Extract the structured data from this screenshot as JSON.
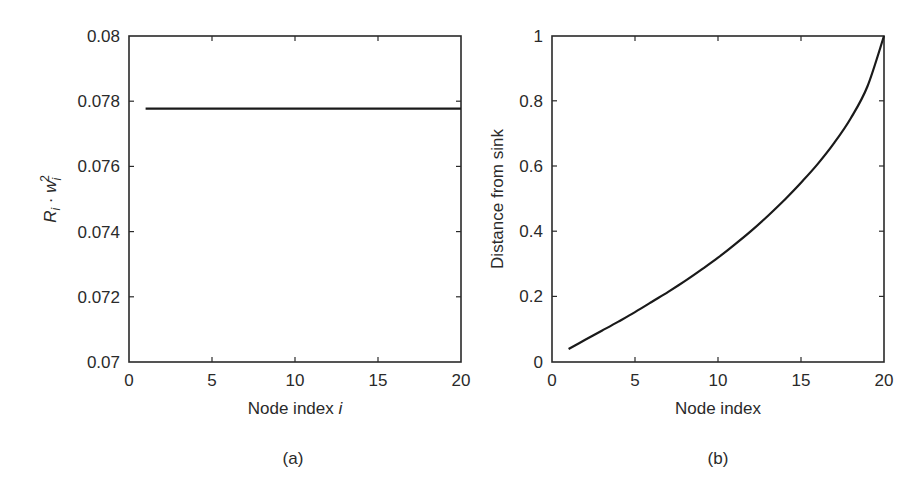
{
  "chart_data": [
    {
      "panel": "(a)",
      "type": "line",
      "title": "",
      "xlabel": "Node index i",
      "ylabel": "R_i · w_i^2",
      "ylabel_display": {
        "base1": "R",
        "sub1": "i",
        "dot": " · ",
        "base2": "w",
        "sub2": "i",
        "sup2": "2"
      },
      "xlim": [
        0,
        20
      ],
      "ylim": [
        0.07,
        0.08
      ],
      "xticks": [
        0,
        5,
        10,
        15,
        20
      ],
      "yticks": [
        0.07,
        0.072,
        0.074,
        0.076,
        0.078,
        0.08
      ],
      "xtick_labels": [
        "0",
        "5",
        "10",
        "15",
        "20"
      ],
      "ytick_labels": [
        "0.07",
        "0.072",
        "0.074",
        "0.076",
        "0.078",
        "0.08"
      ],
      "grid": false,
      "series": [
        {
          "name": "R_i·w_i^2",
          "x": [
            1,
            2,
            3,
            4,
            5,
            6,
            7,
            8,
            9,
            10,
            11,
            12,
            13,
            14,
            15,
            16,
            17,
            18,
            19,
            20
          ],
          "values": [
            0.07777,
            0.07777,
            0.07777,
            0.07777,
            0.07777,
            0.07777,
            0.07777,
            0.07777,
            0.07777,
            0.07777,
            0.07777,
            0.07777,
            0.07777,
            0.07777,
            0.07777,
            0.07777,
            0.07777,
            0.07777,
            0.07777,
            0.07777
          ]
        }
      ]
    },
    {
      "panel": "(b)",
      "type": "line",
      "title": "",
      "xlabel": "Node index",
      "ylabel": "Distance from sink",
      "xlim": [
        0,
        20
      ],
      "ylim": [
        0,
        1
      ],
      "xticks": [
        0,
        5,
        10,
        15,
        20
      ],
      "yticks": [
        0,
        0.2,
        0.4,
        0.6,
        0.8,
        1
      ],
      "xtick_labels": [
        "0",
        "5",
        "10",
        "15",
        "20"
      ],
      "ytick_labels": [
        "0",
        "0.2",
        "0.4",
        "0.6",
        "0.8",
        "1"
      ],
      "grid": false,
      "series": [
        {
          "name": "Distance from sink",
          "x": [
            1,
            2,
            3,
            4,
            5,
            6,
            7,
            8,
            9,
            10,
            11,
            12,
            13,
            14,
            15,
            16,
            17,
            18,
            19,
            20
          ],
          "values": [
            0.04,
            0.068,
            0.096,
            0.124,
            0.153,
            0.184,
            0.215,
            0.248,
            0.283,
            0.32,
            0.36,
            0.402,
            0.448,
            0.497,
            0.55,
            0.607,
            0.672,
            0.748,
            0.845,
            1.0
          ]
        }
      ]
    }
  ],
  "panels": {
    "a": {
      "caption": "(a)",
      "xlabel": "Node index ",
      "xlabel_italic": "i",
      "ylabel_R": "R",
      "ylabel_i1": "i",
      "ylabel_dot": " · ",
      "ylabel_w": "w",
      "ylabel_i2": "i",
      "ylabel_sup": "2",
      "yticks": [
        "0.08",
        "0.078",
        "0.076",
        "0.074",
        "0.072",
        "0.07"
      ],
      "xticks": [
        "0",
        "5",
        "10",
        "15",
        "20"
      ]
    },
    "b": {
      "caption": "(b)",
      "xlabel": "Node index",
      "ylabel": "Distance from sink",
      "yticks": [
        "1",
        "0.8",
        "0.6",
        "0.4",
        "0.2",
        "0"
      ],
      "xticks": [
        "0",
        "5",
        "10",
        "15",
        "20"
      ]
    }
  },
  "colors": {
    "line": "#1a1a1a",
    "axis": "#2a2a2a",
    "background": "#ffffff"
  }
}
